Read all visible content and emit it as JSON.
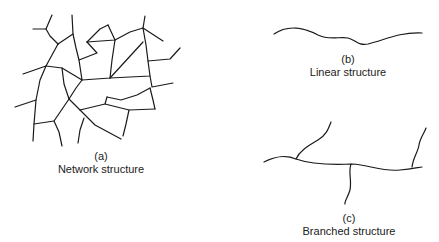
{
  "figure": {
    "panels": [
      {
        "id": "a",
        "letter": "(a)",
        "caption": "Network structure"
      },
      {
        "id": "b",
        "letter": "(b)",
        "caption": "Linear structure"
      },
      {
        "id": "c",
        "letter": "(c)",
        "caption": "Branched structure"
      }
    ],
    "stroke_color": "#1a1a1a",
    "background": "#ffffff"
  }
}
